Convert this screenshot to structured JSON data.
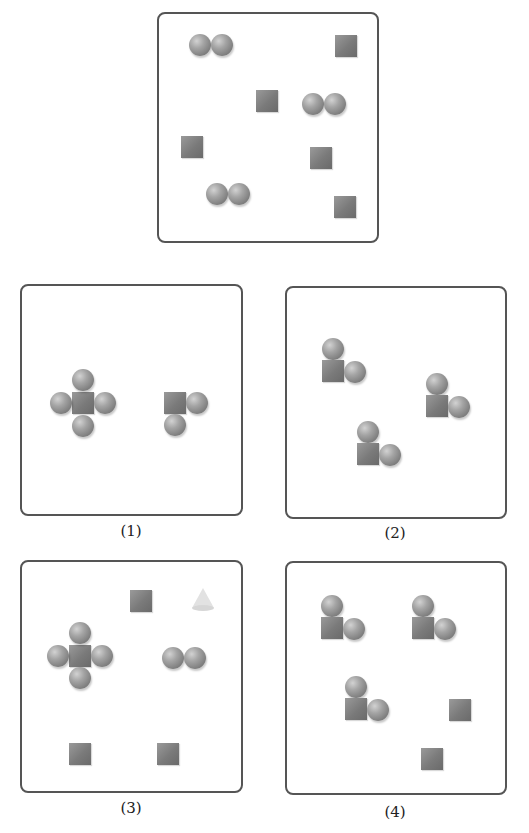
{
  "figure": {
    "reference_panel": {
      "description": "Top reference box",
      "contents": [
        {
          "type": "sphere-pair",
          "count": 3
        },
        {
          "type": "square",
          "count": 5
        }
      ]
    },
    "options": [
      {
        "label": "(1)",
        "contents": "cross (square with 4 spheres) + square with 2 spheres"
      },
      {
        "label": "(2)",
        "contents": "3 groups of square with 2 spheres"
      },
      {
        "label": "(3)",
        "contents": "cross + sphere pair + 3 squares + cone"
      },
      {
        "label": "(4)",
        "contents": "3 groups of square with 2 spheres + 2 squares"
      }
    ]
  },
  "labels": {
    "opt1": "(1)",
    "opt2": "(2)",
    "opt3": "(3)",
    "opt4": "(4)"
  },
  "colors": {
    "shape_gray": "#808080",
    "border": "#555555",
    "cone": "#e2e2e2"
  }
}
